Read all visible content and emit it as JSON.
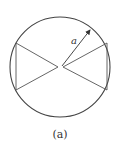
{
  "figure": {
    "radius_label": "a",
    "caption": "(a)",
    "stroke_color": "#444444",
    "circle": {
      "cx": 60,
      "cy": 67,
      "r": 50
    },
    "left_triangle": {
      "top": [
        16,
        43
      ],
      "bottom": [
        16,
        90
      ],
      "apex": [
        58,
        67
      ]
    },
    "right_triangle": {
      "top": [
        107,
        43
      ],
      "bottom": [
        107,
        90
      ],
      "apex": [
        63,
        67
      ]
    },
    "radius_arrow": {
      "from": [
        62,
        66
      ],
      "to": [
        91,
        29
      ]
    }
  }
}
